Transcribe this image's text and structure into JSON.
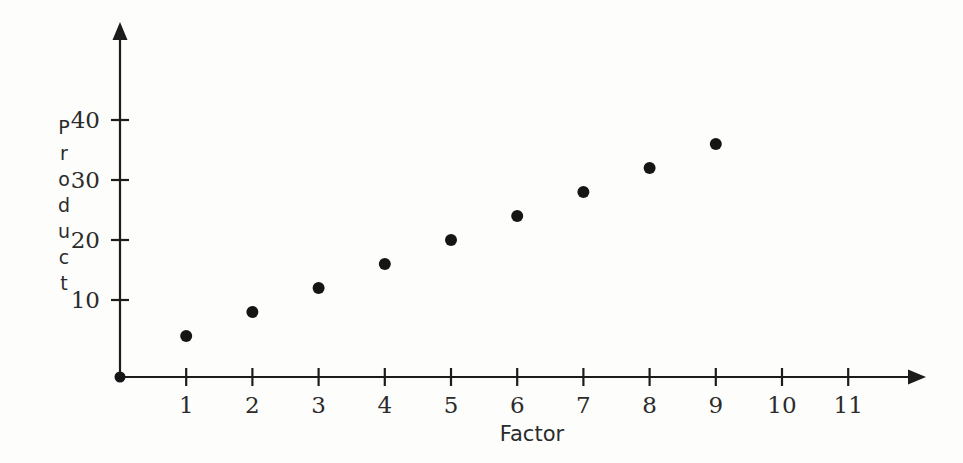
{
  "chart_data": {
    "type": "scatter",
    "title": "",
    "xlabel": "Factor",
    "ylabel": "Product",
    "x": [
      1,
      2,
      3,
      4,
      5,
      6,
      7,
      8,
      9
    ],
    "values": [
      4,
      8,
      12,
      16,
      20,
      24,
      28,
      32,
      36
    ],
    "points": [
      {
        "x": 1,
        "y": 4
      },
      {
        "x": 2,
        "y": 8
      },
      {
        "x": 3,
        "y": 12
      },
      {
        "x": 4,
        "y": 16
      },
      {
        "x": 5,
        "y": 20
      },
      {
        "x": 6,
        "y": 24
      },
      {
        "x": 7,
        "y": 28
      },
      {
        "x": 8,
        "y": 32
      },
      {
        "x": 9,
        "y": 36
      }
    ],
    "origin_point": {
      "x": 0,
      "y": 0
    },
    "xticks": [
      1,
      2,
      3,
      4,
      5,
      6,
      7,
      8,
      9,
      10,
      11
    ],
    "xtick_labels": [
      "1",
      "2",
      "3",
      "4",
      "5",
      "6",
      "7",
      "8",
      "9",
      "10",
      "11"
    ],
    "yticks": [
      10,
      20,
      30,
      40
    ],
    "ytick_labels": [
      "10",
      "20",
      "30",
      "40"
    ],
    "xlim": [
      0,
      12
    ],
    "ylim": [
      0,
      47
    ],
    "grid": false,
    "legend": null,
    "marker": "filled-circle",
    "marker_color": "#151515",
    "axis_color": "#1c1c1c",
    "axis_arrows": true
  },
  "ylabel_letters": [
    "P",
    "r",
    "o",
    "d",
    "u",
    "c",
    "t"
  ],
  "colors": {
    "background": "#fdfdfc",
    "axis": "#1c1c1c",
    "marker": "#151515",
    "text": "#2b2b2b"
  }
}
